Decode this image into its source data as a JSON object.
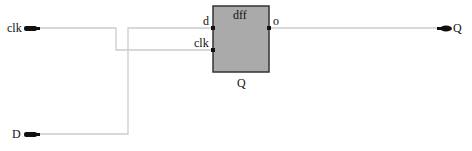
{
  "diagram": {
    "inputs": [
      {
        "id": "clk",
        "label": "clk"
      },
      {
        "id": "D",
        "label": "D"
      }
    ],
    "outputs": [
      {
        "id": "Q",
        "label": "Q"
      }
    ],
    "block": {
      "title": "dff",
      "instance_label": "Q",
      "ports_in": [
        "d",
        "clk"
      ],
      "ports_out": [
        "o"
      ]
    },
    "colors": {
      "block_fill": "#aaaaaa",
      "block_border": "#333333",
      "wire": "#cccccc",
      "port": "#111111"
    }
  }
}
